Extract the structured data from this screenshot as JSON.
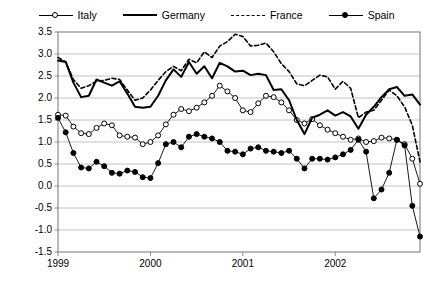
{
  "legend": {
    "items": [
      {
        "label": "Italy",
        "style": "line-open-marker"
      },
      {
        "label": "Germany",
        "style": "thick-solid-line"
      },
      {
        "label": "France",
        "style": "dashed-line"
      },
      {
        "label": "Spain",
        "style": "line-filled-marker"
      }
    ]
  },
  "chart_data": {
    "type": "line",
    "title": "",
    "xlabel": "",
    "ylabel": "",
    "ylim": [
      -1.5,
      3.5
    ],
    "ytick_step": 0.5,
    "yticks": [
      "3.5",
      "3.0",
      "2.5",
      "2.0",
      "1.5",
      "1.0",
      "0.5",
      "0.0",
      "-0.5",
      "-1.0",
      "-1.5"
    ],
    "xticks": [
      "1999",
      "2000",
      "2001",
      "2002"
    ],
    "xtick_index": [
      0,
      12,
      24,
      36
    ],
    "x_count": 48,
    "grid": "horizontal",
    "legend_position": "top",
    "colors": {
      "line": "#000000",
      "grid": "#b3b3b3",
      "frame": "#808080",
      "marker_fill_open": "#ffffff",
      "marker_fill_closed": "#000000"
    },
    "series": [
      {
        "name": "Italy",
        "marker": "open-circle",
        "line": "solid-thin",
        "values": [
          1.62,
          1.6,
          1.35,
          1.2,
          1.18,
          1.32,
          1.42,
          1.38,
          1.15,
          1.12,
          1.1,
          0.95,
          1.0,
          1.15,
          1.4,
          1.62,
          1.75,
          1.7,
          1.78,
          1.9,
          2.05,
          2.28,
          2.15,
          2.0,
          1.72,
          1.68,
          1.88,
          2.05,
          2.02,
          1.9,
          1.72,
          1.5,
          1.42,
          1.52,
          1.38,
          1.28,
          1.2,
          1.12,
          1.05,
          1.08,
          1.0,
          1.02,
          1.1,
          1.08,
          1.05,
          0.95,
          0.62,
          0.05
        ]
      },
      {
        "name": "Germany",
        "marker": "none",
        "line": "thick-solid",
        "values": [
          2.85,
          2.82,
          2.35,
          2.02,
          2.05,
          2.42,
          2.35,
          2.28,
          2.38,
          2.1,
          1.8,
          1.78,
          1.8,
          2.05,
          2.4,
          2.65,
          2.48,
          2.82,
          2.55,
          2.72,
          2.45,
          2.8,
          2.72,
          2.6,
          2.62,
          2.52,
          2.55,
          2.52,
          2.18,
          2.2,
          1.95,
          1.5,
          1.18,
          1.55,
          1.62,
          1.72,
          1.6,
          1.68,
          1.58,
          1.3,
          1.62,
          1.8,
          2.02,
          2.2,
          2.25,
          2.05,
          2.08,
          1.85
        ]
      },
      {
        "name": "France",
        "marker": "none",
        "line": "dashed",
        "values": [
          2.92,
          2.82,
          2.42,
          2.22,
          2.28,
          2.38,
          2.4,
          2.45,
          2.42,
          2.18,
          1.95,
          2.0,
          2.18,
          2.4,
          2.6,
          2.72,
          2.62,
          2.88,
          2.8,
          3.05,
          2.92,
          3.18,
          3.28,
          3.45,
          3.4,
          3.18,
          3.2,
          3.25,
          3.05,
          2.78,
          2.6,
          2.32,
          2.28,
          2.4,
          2.52,
          2.48,
          2.2,
          2.38,
          2.22,
          1.55,
          1.68,
          1.72,
          1.95,
          2.18,
          2.05,
          1.8,
          1.38,
          0.55
        ]
      },
      {
        "name": "Spain",
        "marker": "filled-circle",
        "line": "solid-thin",
        "values": [
          1.55,
          1.22,
          0.75,
          0.42,
          0.4,
          0.55,
          0.45,
          0.3,
          0.28,
          0.35,
          0.32,
          0.2,
          0.18,
          0.52,
          0.95,
          1.0,
          0.88,
          1.12,
          1.18,
          1.12,
          1.08,
          1.0,
          0.8,
          0.78,
          0.72,
          0.85,
          0.88,
          0.8,
          0.78,
          0.75,
          0.8,
          0.62,
          0.4,
          0.62,
          0.62,
          0.6,
          0.65,
          0.72,
          0.82,
          1.05,
          0.78,
          -0.28,
          -0.08,
          0.3,
          1.05,
          0.92,
          -0.45,
          -1.15
        ]
      }
    ]
  }
}
